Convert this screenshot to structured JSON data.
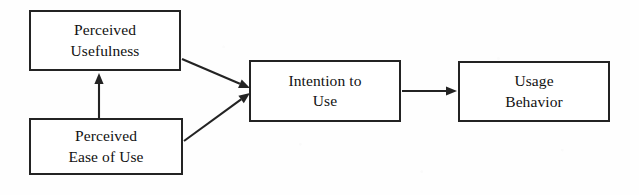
{
  "figure": {
    "background_color": "#fefefe",
    "stroke_color": "#232323",
    "text_color": "#111111"
  },
  "nodes": [
    {
      "id": "perceived-usefulness",
      "label": "Perceived\nUsefulness",
      "line1": "Perceived",
      "line2": "Usefulness",
      "x": 29,
      "y": 10,
      "width": 152,
      "height": 61
    },
    {
      "id": "perceived-ease-of-use",
      "label": "Perceived\nEase of Use",
      "line1": "Perceived",
      "line2": "Ease of Use",
      "x": 29,
      "y": 118,
      "width": 154,
      "height": 57
    },
    {
      "id": "intention-to-use",
      "label": "Intention to\nUse",
      "line1": "Intention to",
      "line2": "Use",
      "x": 249,
      "y": 60,
      "width": 152,
      "height": 62
    },
    {
      "id": "usage-behavior",
      "label": "Usage\nBehavior",
      "line1": "Usage",
      "line2": "Behavior",
      "x": 458,
      "y": 61,
      "width": 152,
      "height": 61
    }
  ],
  "edges": [
    {
      "id": "ease-of-use-to-usefulness",
      "from": "perceived-ease-of-use",
      "to": "perceived-usefulness",
      "orientation": "vertical-up",
      "x1": 99,
      "y1": 118,
      "x2": 99,
      "y2": 73
    },
    {
      "id": "usefulness-to-intention",
      "from": "perceived-usefulness",
      "to": "intention-to-use",
      "orientation": "diagonal-down-right",
      "x1": 182,
      "y1": 59,
      "x2": 250,
      "y2": 88
    },
    {
      "id": "ease-of-use-to-intention",
      "from": "perceived-ease-of-use",
      "to": "intention-to-use",
      "orientation": "diagonal-up-right",
      "x1": 184,
      "y1": 141,
      "x2": 250,
      "y2": 93
    },
    {
      "id": "intention-to-usage",
      "from": "intention-to-use",
      "to": "usage-behavior",
      "orientation": "horizontal-right",
      "x1": 402,
      "y1": 91,
      "x2": 457,
      "y2": 91
    }
  ]
}
